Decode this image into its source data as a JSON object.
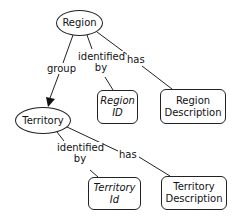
{
  "diagram": {
    "nodes": {
      "region": {
        "label": "Region",
        "shape": "ellipse"
      },
      "territory": {
        "label": "Territory",
        "shape": "ellipse"
      },
      "region_id": {
        "label_line1": "Region",
        "label_line2": "ID",
        "shape": "rounded-box",
        "italic": true
      },
      "region_description": {
        "label_line1": "Region",
        "label_line2": "Description",
        "shape": "rounded-box"
      },
      "territory_id": {
        "label_line1": "Territory",
        "label_line2": "Id",
        "shape": "rounded-box",
        "italic": true
      },
      "territory_description": {
        "label_line1": "Territory",
        "label_line2": "Description",
        "shape": "rounded-box"
      }
    },
    "edges": {
      "region_group_territory": {
        "label": "group",
        "from": "Region",
        "to": "Territory",
        "arrow": true
      },
      "region_identified_by": {
        "label_line1": "identified",
        "label_line2": "by",
        "from": "Region",
        "to": "Region ID"
      },
      "region_has": {
        "label": "has",
        "from": "Region",
        "to": "Region Description"
      },
      "territory_identified_by": {
        "label_line1": "identified",
        "label_line2": "by",
        "from": "Territory",
        "to": "Territory Id"
      },
      "territory_has": {
        "label": "has",
        "from": "Territory",
        "to": "Territory Description"
      }
    }
  }
}
